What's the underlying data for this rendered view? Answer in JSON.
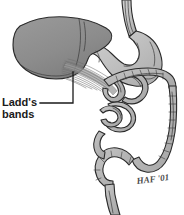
{
  "figure": {
    "background_color": "#ffffff",
    "width": 184,
    "height": 215
  },
  "labels": {
    "ladds_bands_line1": "Ladd's",
    "ladds_bands_line2": "bands"
  },
  "signature": {
    "text": "HAF '01"
  },
  "structures": [
    {
      "name": "esophagus",
      "fill": "#c0c0c0"
    },
    {
      "name": "stomach",
      "fill": "#c4c4c4"
    },
    {
      "name": "liver",
      "fill": "#8e8e8e"
    },
    {
      "name": "duodenum",
      "fill": "#bdbdbd"
    },
    {
      "name": "small-bowel",
      "fill": "#b8b8b8"
    },
    {
      "name": "colon",
      "fill": "#b4b4b4"
    },
    {
      "name": "rectum",
      "fill": "#bdbdbd"
    },
    {
      "name": "ladds-bands",
      "fill": "#9a9a9a"
    }
  ],
  "colors": {
    "outline": "#2b2b2b",
    "liver_fill": "#8e8e8e",
    "liver_shadow": "#7d7d7d",
    "stomach_fill": "#c4c4c4",
    "bowel_fill": "#b6b6b6",
    "bowel_light": "#cfcfcf",
    "band_stroke": "#6e6e6e",
    "label_color": "#1a1a1a",
    "signature_color": "#4a4a4a"
  }
}
